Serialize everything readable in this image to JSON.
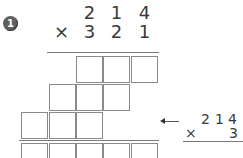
{
  "problem": {
    "number": "1",
    "multiplicand_digits": [
      "2",
      "1",
      "4"
    ],
    "operator": "×",
    "multiplier_digits": [
      "3",
      "2",
      "1"
    ]
  },
  "grid": {
    "row1_boxes": 3,
    "row2_boxes": 3,
    "row3_boxes": 3,
    "result_boxes": 5
  },
  "hint": {
    "multiplicand_digits": [
      "2",
      "1",
      "4"
    ],
    "operator": "×",
    "multiplier_digit": "3"
  }
}
